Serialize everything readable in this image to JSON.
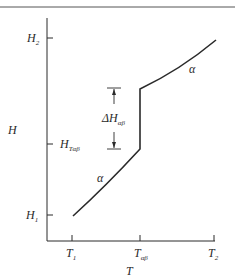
{
  "diagram": {
    "type": "enthalpy-temperature phase transition plot",
    "axes": {
      "x": {
        "label": "T",
        "ticks": [
          {
            "main": "T",
            "sub": "1"
          },
          {
            "main": "T",
            "sub": "αβ"
          },
          {
            "main": "T",
            "sub": "2"
          }
        ]
      },
      "y": {
        "label": "H",
        "ticks": [
          {
            "main": "H",
            "sub": "2"
          },
          {
            "main": "H",
            "sub": "Tαβ"
          },
          {
            "main": "H",
            "sub": "1"
          }
        ]
      }
    },
    "phase_labels": {
      "lower": "α",
      "upper": "α"
    },
    "jump_label": {
      "main": "ΔH",
      "sub": "αβ"
    },
    "colors": {
      "line": "#2a2a2a",
      "background": "#ffffff"
    }
  }
}
